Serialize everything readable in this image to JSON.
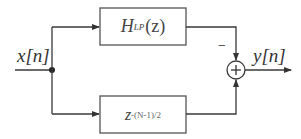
{
  "diagram": {
    "type": "block-diagram",
    "input": {
      "symbol": "x",
      "index": "n",
      "label": "x[n]"
    },
    "output": {
      "symbol": "y",
      "index": "n",
      "label": "y[n]"
    },
    "blocks": [
      {
        "id": "lowpass",
        "name": "H",
        "subscript": "LP",
        "arg": "(z)",
        "label": "H_LP(z)"
      },
      {
        "id": "delay",
        "base": "z",
        "exponent": "-(N-1)/2",
        "label": "z^{-(N-1)/2}"
      }
    ],
    "summer": {
      "symbol": "+",
      "inputs": [
        {
          "from": "lowpass",
          "sign": "−"
        },
        {
          "from": "delay",
          "sign": "+"
        }
      ]
    },
    "colors": {
      "line": "#3a3a3a",
      "box_stroke": "#555555",
      "text": "#333333",
      "background": "#ffffff"
    }
  }
}
